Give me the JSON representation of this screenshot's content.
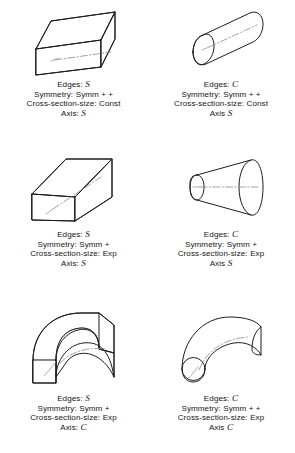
{
  "figure": {
    "background": "#ffffff",
    "ink": "#1d1d1d",
    "axis_color": "#8a8a8a",
    "columns": 2,
    "rows": 3,
    "caption_labels": {
      "edges": "Edges:",
      "symmetry": "Symmetry:",
      "cross_section": "Cross-section-size:",
      "axis_colon": "Axis:",
      "axis_nocolon": "Axis"
    }
  },
  "shapes": [
    {
      "id": "straight-box",
      "icon": "rectangular-prism-icon",
      "position": "row1-left",
      "edges_label": "Edges:",
      "edges": "S",
      "symmetry_label": "Symmetry:",
      "symmetry": "Symm + +",
      "cross_label": "Cross-section-size:",
      "cross": "Const",
      "axis_label": "Axis:",
      "axis": "S"
    },
    {
      "id": "straight-cylinder",
      "icon": "cylinder-icon",
      "position": "row1-right",
      "edges_label": "Edges:",
      "edges": "C",
      "symmetry_label": "Symmetry:",
      "symmetry": "Symm + +",
      "cross_label": "Cross-section-size:",
      "cross": "Const",
      "axis_label": "Axis",
      "axis": "S"
    },
    {
      "id": "tapered-box",
      "icon": "expanding-prism-icon",
      "position": "row2-left",
      "edges_label": "Edges:",
      "edges": "S",
      "symmetry_label": "Symmetry:",
      "symmetry": "Symm +",
      "cross_label": "Cross-section-size:",
      "cross": "Exp",
      "axis_label": "Axis:",
      "axis": "S"
    },
    {
      "id": "cone-frustum",
      "icon": "truncated-cone-icon",
      "position": "row2-right",
      "edges_label": "Edges:",
      "edges": "C",
      "symmetry_label": "Symmetry:",
      "symmetry": "Symm +",
      "cross_label": "Cross-section-size:",
      "cross": "Exp",
      "axis_label": "Axis",
      "axis": "S"
    },
    {
      "id": "curved-box",
      "icon": "bent-prism-icon",
      "position": "row3-left",
      "edges_label": "Edges:",
      "edges": "S",
      "symmetry_label": "Symmetry:",
      "symmetry": "Symm +",
      "cross_label": "Cross-section-size:",
      "cross": "Exp",
      "axis_label": "Axis:",
      "axis": "C"
    },
    {
      "id": "curved-tube",
      "icon": "bent-cylinder-icon",
      "position": "row3-right",
      "edges_label": "Edges:",
      "edges": "C",
      "symmetry_label": "Symmetry:",
      "symmetry": "Symm + +",
      "cross_label": "Cross-section-size:",
      "cross": "Exp",
      "axis_label": "Axis",
      "axis": "C"
    }
  ]
}
